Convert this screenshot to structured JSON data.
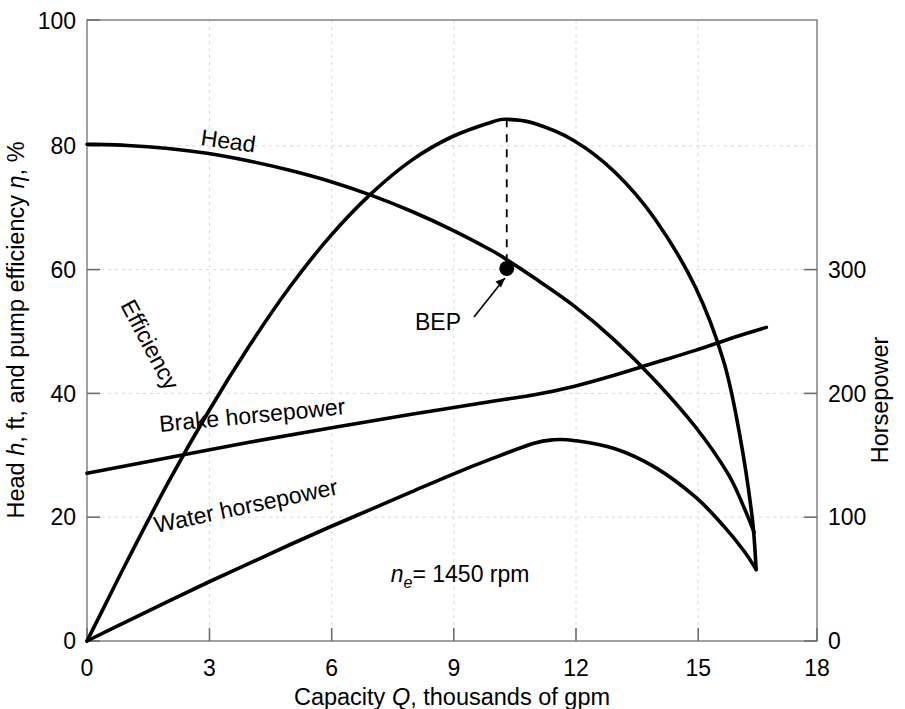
{
  "chart_data": {
    "type": "line",
    "title": "",
    "subtitle": "",
    "xlabel": "Capacity Q, thousands of gpm",
    "ylabel": "Head h, ft, and pump efficiency η, %",
    "y2label": "Horsepower",
    "xlim": [
      0,
      18
    ],
    "ylim": [
      0,
      100
    ],
    "y2lim": [
      0,
      500
    ],
    "grid": true,
    "legend": "inline-curve-labels",
    "xticks": [
      0,
      3,
      6,
      9,
      12,
      15,
      18
    ],
    "xticklabels": [
      "0",
      "3",
      "6",
      "9",
      "12",
      "15",
      "18"
    ],
    "yticks": [
      0,
      20,
      40,
      60,
      80,
      100
    ],
    "yticklabels": [
      "0",
      "20",
      "40",
      "60",
      "80",
      "100"
    ],
    "y2ticks": [
      0,
      100,
      200,
      300
    ],
    "y2ticklabels": [
      "0",
      "100",
      "200",
      "300"
    ],
    "series": [
      {
        "name": "Head",
        "label": "Head",
        "axis": "left",
        "units": "ft",
        "points": [
          [
            0.0,
            80.0
          ],
          [
            1.0,
            79.8
          ],
          [
            2.0,
            79.3
          ],
          [
            3.0,
            78.5
          ],
          [
            4.0,
            77.3
          ],
          [
            5.0,
            75.8
          ],
          [
            6.0,
            74.0
          ],
          [
            7.0,
            71.8
          ],
          [
            8.0,
            69.2
          ],
          [
            9.0,
            66.2
          ],
          [
            10.0,
            62.8
          ],
          [
            10.35,
            61.4
          ],
          [
            11.0,
            58.6
          ],
          [
            12.0,
            54.0
          ],
          [
            13.0,
            48.5
          ],
          [
            14.0,
            42.0
          ],
          [
            15.0,
            34.5
          ],
          [
            15.8,
            27.0
          ],
          [
            16.2,
            21.5
          ],
          [
            16.45,
            17.5
          ]
        ]
      },
      {
        "name": "Efficiency",
        "label": "Efficiency",
        "axis": "left",
        "units": "%",
        "points": [
          [
            0.0,
            0.0
          ],
          [
            0.5,
            6.5
          ],
          [
            1.0,
            13.0
          ],
          [
            2.0,
            25.5
          ],
          [
            3.0,
            37.0
          ],
          [
            4.0,
            47.5
          ],
          [
            5.0,
            57.0
          ],
          [
            6.0,
            65.2
          ],
          [
            7.0,
            72.0
          ],
          [
            8.0,
            77.4
          ],
          [
            9.0,
            81.2
          ],
          [
            10.0,
            83.6
          ],
          [
            10.35,
            84.0
          ],
          [
            11.0,
            83.4
          ],
          [
            12.0,
            80.6
          ],
          [
            13.0,
            75.6
          ],
          [
            14.0,
            68.0
          ],
          [
            15.0,
            57.0
          ],
          [
            15.7,
            45.0
          ],
          [
            16.1,
            33.0
          ],
          [
            16.4,
            20.0
          ],
          [
            16.5,
            11.5
          ]
        ]
      },
      {
        "name": "Brake horsepower",
        "label": "Brake horsepower",
        "axis": "right",
        "units": "hp",
        "points_left_scale": [
          [
            0.0,
            27.0
          ],
          [
            2.0,
            29.5
          ],
          [
            4.0,
            32.0
          ],
          [
            6.0,
            34.3
          ],
          [
            8.0,
            36.5
          ],
          [
            10.0,
            38.6
          ],
          [
            11.0,
            39.6
          ],
          [
            12.0,
            41.0
          ],
          [
            13.0,
            42.8
          ],
          [
            14.0,
            44.8
          ],
          [
            15.0,
            46.8
          ],
          [
            16.0,
            49.0
          ],
          [
            16.75,
            50.5
          ]
        ],
        "points_hp": [
          [
            0.0,
            135
          ],
          [
            2.0,
            148
          ],
          [
            4.0,
            160
          ],
          [
            6.0,
            172
          ],
          [
            8.0,
            183
          ],
          [
            10.0,
            193
          ],
          [
            11.0,
            198
          ],
          [
            12.0,
            205
          ],
          [
            13.0,
            214
          ],
          [
            14.0,
            224
          ],
          [
            15.0,
            234
          ],
          [
            16.0,
            245
          ],
          [
            16.75,
            252
          ]
        ]
      },
      {
        "name": "Water horsepower",
        "label": "Water horsepower",
        "axis": "right",
        "units": "hp",
        "points_left_scale": [
          [
            0.0,
            0.0
          ],
          [
            1.0,
            3.2
          ],
          [
            2.0,
            6.4
          ],
          [
            3.0,
            9.5
          ],
          [
            4.0,
            12.5
          ],
          [
            5.0,
            15.5
          ],
          [
            6.0,
            18.4
          ],
          [
            7.0,
            21.2
          ],
          [
            8.0,
            24.0
          ],
          [
            9.0,
            26.8
          ],
          [
            10.0,
            29.4
          ],
          [
            11.0,
            31.8
          ],
          [
            11.5,
            32.4
          ],
          [
            12.0,
            32.3
          ],
          [
            13.0,
            31.0
          ],
          [
            14.0,
            28.0
          ],
          [
            15.0,
            23.2
          ],
          [
            15.7,
            18.5
          ],
          [
            16.2,
            14.5
          ],
          [
            16.5,
            11.5
          ]
        ],
        "points_hp": [
          [
            0.0,
            0
          ],
          [
            1.0,
            16
          ],
          [
            2.0,
            32
          ],
          [
            3.0,
            48
          ],
          [
            4.0,
            63
          ],
          [
            5.0,
            78
          ],
          [
            6.0,
            92
          ],
          [
            7.0,
            106
          ],
          [
            8.0,
            120
          ],
          [
            9.0,
            134
          ],
          [
            10.0,
            147
          ],
          [
            11.0,
            159
          ],
          [
            11.5,
            162
          ],
          [
            12.0,
            162
          ],
          [
            13.0,
            155
          ],
          [
            14.0,
            140
          ],
          [
            15.0,
            116
          ],
          [
            15.7,
            93
          ],
          [
            16.2,
            73
          ],
          [
            16.5,
            58
          ]
        ]
      }
    ],
    "annotations": [
      {
        "name": "bep",
        "label": "BEP",
        "marker_point": [
          10.35,
          60.0
        ],
        "dashed_from": [
          10.35,
          84.0
        ],
        "dashed_to": [
          10.35,
          60.0
        ],
        "note": "Best efficiency point on head curve; head = 60 ft at Q = 10.35"
      },
      {
        "name": "speed",
        "label_prefix": "n",
        "label_sub": "e",
        "label_suffix": " = 1450 rpm",
        "full_text": "n_e = 1450 rpm",
        "position": [
          9.2,
          9.5
        ]
      }
    ]
  },
  "axes": {
    "left": {
      "title": "Head h, ft, and pump efficiency η, %",
      "title_parts": {
        "pre": "Head ",
        "italic": "h",
        "post": ", ft, and pump efficiency ",
        "eta": "η",
        "tail": ", %"
      },
      "labels": [
        "100",
        "80",
        "60",
        "40",
        "20",
        "0"
      ]
    },
    "right": {
      "title": "Horsepower",
      "labels": [
        "300",
        "200",
        "100",
        "0"
      ]
    },
    "bottom": {
      "title_pre": "Capacity ",
      "title_italic": "Q",
      "title_post": ", thousands of gpm",
      "title": "Capacity Q, thousands of gpm",
      "labels": [
        "0",
        "3",
        "6",
        "9",
        "12",
        "15",
        "18"
      ]
    }
  },
  "curve_labels": {
    "head": "Head",
    "efficiency": "Efficiency",
    "brake_horsepower": "Brake horsepower",
    "water_horsepower": "Water horsepower"
  },
  "annotations_text": {
    "bep": "BEP",
    "speed_n": "n",
    "speed_sub": "e",
    "speed_rest": "= 1450 rpm"
  },
  "colors": {
    "curve": "#000000",
    "frame": "#8a8a8a",
    "grid": "#d8d8d8",
    "background": "#ffffff"
  }
}
